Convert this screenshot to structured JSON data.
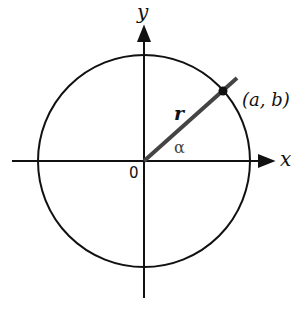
{
  "diagram": {
    "type": "unit-circle-angle",
    "axes": {
      "x_label": "x",
      "y_label": "y",
      "origin_label": "0"
    },
    "circle": {
      "center": [
        144,
        161
      ],
      "radius": 106
    },
    "ray": {
      "label": "r",
      "from": [
        144,
        161
      ],
      "to": [
        237,
        78
      ]
    },
    "point": {
      "label": "(a, b)",
      "position": [
        223,
        91
      ]
    },
    "angle": {
      "label": "α"
    },
    "colors": {
      "stroke": "#111111",
      "ray": "#444444",
      "background": "#ffffff"
    }
  }
}
